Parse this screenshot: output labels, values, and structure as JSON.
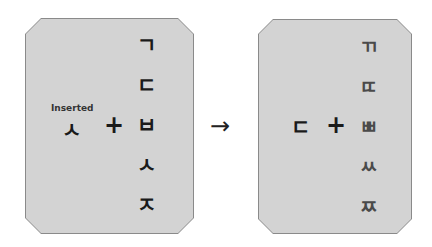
{
  "left_panel": {
    "label": "Inserted",
    "inserted_jamo": "ㅅ",
    "operator": "+",
    "column": [
      "ㄱ",
      "ㄷ",
      "ㅂ",
      "ㅅ",
      "ㅈ"
    ]
  },
  "arrow": "→",
  "right_panel": {
    "inserted_jamo": "ㄷ",
    "operator": "+",
    "column": [
      "ㄲ",
      "ㄸ",
      "ㅃ",
      "ㅆ",
      "ㅉ"
    ]
  },
  "colors": {
    "panel_fill": "#d3d3d3",
    "panel_border": "#8a8a8a",
    "text_dark": "#1a1a1a",
    "text_gray": "#4a4a4a"
  }
}
